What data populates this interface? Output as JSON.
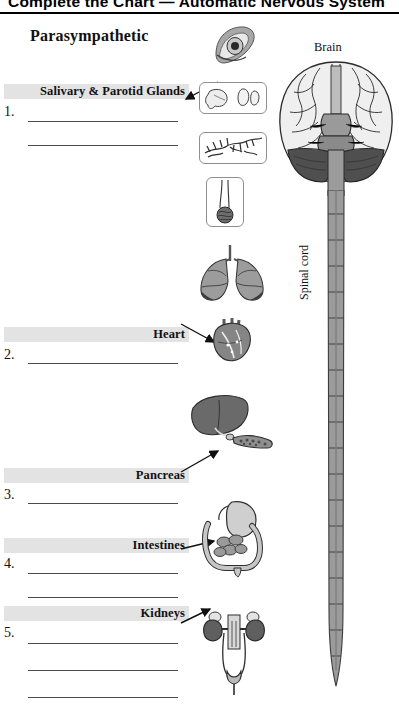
{
  "header": {
    "title": "Complete the Chart — Automatic Nervous System",
    "rule": "horizontal-rule"
  },
  "section": {
    "title": "Parasympathetic"
  },
  "rows": [
    {
      "number": "1.",
      "label": "Salivary & Parotid Glands",
      "blank_lines": 2
    },
    {
      "number": "2.",
      "label": "Heart",
      "blank_lines": 1
    },
    {
      "number": "3.",
      "label": "Pancreas",
      "blank_lines": 1
    },
    {
      "number": "4.",
      "label": "Intestines",
      "blank_lines": 2
    },
    {
      "number": "5.",
      "label": "Kidneys",
      "blank_lines": 3
    }
  ],
  "diagram": {
    "brain_label": "Brain",
    "spinal_cord_label": "Spinal cord",
    "organs": [
      {
        "name": "eye-illustration",
        "caption": ""
      },
      {
        "name": "salivary-glands-illustration",
        "caption": ""
      },
      {
        "name": "blood-vessels-illustration",
        "caption": ""
      },
      {
        "name": "hair-follicle-illustration",
        "caption": ""
      },
      {
        "name": "lungs-illustration",
        "caption": ""
      },
      {
        "name": "heart-illustration",
        "caption": ""
      },
      {
        "name": "liver-pancreas-illustration",
        "caption": ""
      },
      {
        "name": "intestines-illustration",
        "caption": ""
      },
      {
        "name": "kidneys-bladder-illustration",
        "caption": ""
      }
    ]
  },
  "colors": {
    "label_bar": "#e3e3e3",
    "rule": "#000000",
    "line": "#4a4a4a",
    "organ_dark": "#6f6f6f",
    "organ_mid": "#9a9a9a",
    "organ_light": "#cfcfcf"
  }
}
